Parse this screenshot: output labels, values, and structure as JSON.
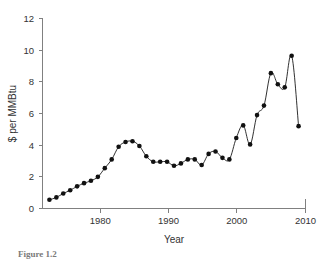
{
  "chart_data": {
    "type": "line",
    "title": "",
    "xlabel": "Year",
    "ylabel": "$ per MMBtu",
    "xlim": [
      1972,
      2010
    ],
    "ylim": [
      0,
      12
    ],
    "xticks": [
      1980,
      1990,
      2000,
      2010
    ],
    "yticks": [
      0,
      2,
      4,
      6,
      8,
      10,
      12
    ],
    "grid": false,
    "legend": "none",
    "markers": "filled-circle",
    "series": [
      {
        "name": "Natural gas price",
        "x": [
          1973,
          1974,
          1975,
          1976,
          1977,
          1978,
          1979,
          1980,
          1981,
          1982,
          1983,
          1984,
          1985,
          1986,
          1987,
          1988,
          1989,
          1990,
          1991,
          1992,
          1993,
          1994,
          1995,
          1996,
          1997,
          1998,
          1999,
          2000,
          2001,
          2002,
          2003,
          2004,
          2005,
          2006,
          2007,
          2008,
          2009
        ],
        "values": [
          0.55,
          0.7,
          0.95,
          1.15,
          1.4,
          1.6,
          1.75,
          2.0,
          2.55,
          3.1,
          3.9,
          4.2,
          4.25,
          3.95,
          3.3,
          2.95,
          2.95,
          2.95,
          2.7,
          2.85,
          3.1,
          3.1,
          2.75,
          3.45,
          3.6,
          3.2,
          3.1,
          4.45,
          5.25,
          4.05,
          5.9,
          6.5,
          8.55,
          7.85,
          7.65,
          9.65,
          5.2
        ]
      }
    ]
  },
  "axes": {
    "y_ticks": [
      "0",
      "2",
      "4",
      "6",
      "8",
      "10",
      "12"
    ],
    "x_ticks": [
      "1980",
      "1990",
      "2000",
      "2010"
    ],
    "y_title": "$ per MMBtu",
    "x_title": "Year"
  },
  "caption": {
    "label": "Figure 1.2",
    "text": ""
  }
}
